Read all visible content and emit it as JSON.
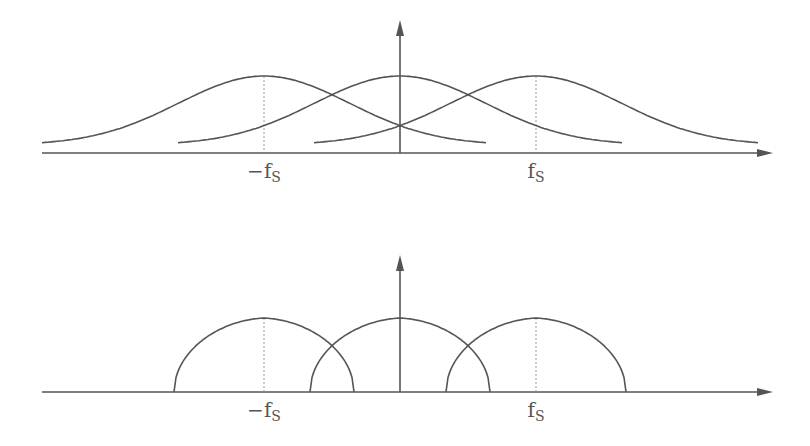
{
  "colors": {
    "line": "#555555",
    "guide": "#999999",
    "background": "#ffffff"
  },
  "panels": [
    {
      "name": "overlapping-gaussian-spectra",
      "axis_y": 153,
      "axis_x_start": 42,
      "axis_x_end": 773,
      "vaxis_x": 400,
      "vaxis_top": 20,
      "peak_y": 76,
      "base_y": 145,
      "shape": "gaussian",
      "half_width": 222,
      "centers": [
        264,
        400,
        536
      ],
      "guides": [
        264,
        536
      ],
      "labels": [
        {
          "text": "−f",
          "sub": "S",
          "x": 264
        },
        {
          "text": "f",
          "sub": "S",
          "x": 536
        }
      ]
    },
    {
      "name": "non-overlapping-arc-spectra",
      "axis_y": 392,
      "axis_x_start": 42,
      "axis_x_end": 773,
      "vaxis_x": 400,
      "vaxis_top": 255,
      "peak_y": 318,
      "base_y": 392,
      "shape": "arc",
      "half_width": 90,
      "centers": [
        264,
        400,
        536
      ],
      "guides": [
        264,
        536
      ],
      "labels": [
        {
          "text": "−f",
          "sub": "S",
          "x": 264
        },
        {
          "text": "f",
          "sub": "S",
          "x": 536
        }
      ]
    }
  ]
}
